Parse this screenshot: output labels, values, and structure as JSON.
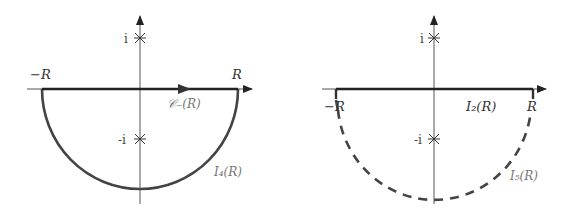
{
  "figure": {
    "panels": [
      {
        "id": "left",
        "axis_labels": {
          "left_end": "−R",
          "right_end": "R"
        },
        "poles": {
          "upper": "i",
          "lower": "-i"
        },
        "contour_label": "C_(R)",
        "contour_label_text": "𝒞₋(R)",
        "arc_label_text": "I₄(R)",
        "arc_style": "solid",
        "segment_arrow": true
      },
      {
        "id": "right",
        "axis_labels": {
          "left_end": "−R",
          "right_end": "R"
        },
        "poles": {
          "upper": "i",
          "lower": "-i"
        },
        "segment_label_text": "I₂(R)",
        "arc_label_text": "I₅(R)",
        "arc_style": "dashed",
        "segment_arrow": false
      }
    ],
    "colors": {
      "axis": "#555555",
      "contour": "#333333",
      "label_grey": "#777777"
    }
  }
}
